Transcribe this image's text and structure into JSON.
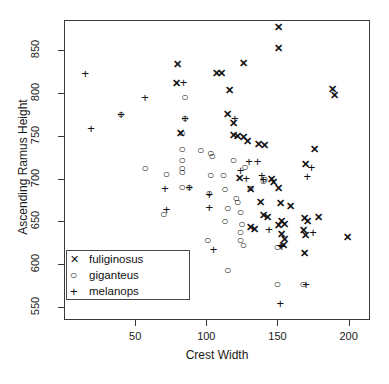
{
  "chart_data": {
    "type": "scatter",
    "title": "",
    "xlabel": "Crest Width",
    "ylabel": "Ascending Ramus Height",
    "xlim": [
      0,
      215
    ],
    "ylim": [
      535,
      885
    ],
    "xticks": [
      50,
      100,
      150,
      200
    ],
    "yticks": [
      550,
      600,
      650,
      700,
      750,
      800,
      850
    ],
    "grid": false,
    "legend_position": "bottom-left",
    "series": [
      {
        "name": "fuliginosus",
        "marker": "X",
        "glyph": "✕",
        "points": [
          [
            151,
            877
          ],
          [
            151,
            852
          ],
          [
            126,
            835
          ],
          [
            80,
            834
          ],
          [
            107,
            823
          ],
          [
            111,
            823
          ],
          [
            116,
            803
          ],
          [
            79,
            812
          ],
          [
            189,
            804
          ],
          [
            190,
            798
          ],
          [
            115,
            775
          ],
          [
            119,
            765
          ],
          [
            119,
            751
          ],
          [
            122,
            750
          ],
          [
            126,
            748
          ],
          [
            82,
            753
          ],
          [
            129,
            744
          ],
          [
            137,
            740
          ],
          [
            141,
            739
          ],
          [
            176,
            735
          ],
          [
            170,
            717
          ],
          [
            151,
            689
          ],
          [
            131,
            688
          ],
          [
            146,
            700
          ],
          [
            147,
            696
          ],
          [
            138,
            673
          ],
          [
            152,
            671
          ],
          [
            159,
            668
          ],
          [
            140,
            658
          ],
          [
            143,
            655
          ],
          [
            153,
            651
          ],
          [
            155,
            647
          ],
          [
            151,
            646
          ],
          [
            169,
            654
          ],
          [
            171,
            651
          ],
          [
            179,
            655
          ],
          [
            131,
            643
          ],
          [
            134,
            641
          ],
          [
            168,
            640
          ],
          [
            170,
            634
          ],
          [
            153,
            635
          ],
          [
            155,
            629
          ],
          [
            154,
            622
          ],
          [
            169,
            613
          ],
          [
            199,
            632
          ],
          [
            123,
            701
          ]
        ]
      },
      {
        "name": "giganteus",
        "marker": "O",
        "glyph": "○",
        "points": [
          [
            40,
            775
          ],
          [
            85,
            795
          ],
          [
            85,
            771
          ],
          [
            83,
            753
          ],
          [
            83,
            735
          ],
          [
            83,
            722
          ],
          [
            83,
            712
          ],
          [
            83,
            708
          ],
          [
            83,
            690
          ],
          [
            72,
            705
          ],
          [
            57,
            712
          ],
          [
            70,
            659
          ],
          [
            96,
            733
          ],
          [
            103,
            730
          ],
          [
            104,
            726
          ],
          [
            103,
            704
          ],
          [
            102,
            683
          ],
          [
            101,
            628
          ],
          [
            112,
            704
          ],
          [
            113,
            688
          ],
          [
            115,
            666
          ],
          [
            113,
            651
          ],
          [
            115,
            593
          ],
          [
            121,
            677
          ],
          [
            122,
            673
          ],
          [
            124,
            661
          ],
          [
            125,
            647
          ],
          [
            124,
            638
          ],
          [
            124,
            628
          ],
          [
            126,
            623
          ],
          [
            127,
            713
          ],
          [
            131,
            689
          ],
          [
            141,
            700
          ],
          [
            140,
            697
          ],
          [
            150,
            620
          ],
          [
            168,
            577
          ],
          [
            150,
            577
          ],
          [
            119,
            722
          ],
          [
            88,
            690
          ]
        ]
      },
      {
        "name": "melanops",
        "marker": "+",
        "glyph": "+",
        "points": [
          [
            15,
            823
          ],
          [
            19,
            759
          ],
          [
            57,
            795
          ],
          [
            84,
            813
          ],
          [
            71,
            689
          ],
          [
            72,
            665
          ],
          [
            88,
            690
          ],
          [
            102,
            682
          ],
          [
            102,
            667
          ],
          [
            105,
            618
          ],
          [
            124,
            710
          ],
          [
            130,
            721
          ],
          [
            136,
            721
          ],
          [
            139,
            704
          ],
          [
            140,
            700
          ],
          [
            152,
            622
          ],
          [
            153,
            621
          ],
          [
            171,
            703
          ],
          [
            174,
            714
          ],
          [
            175,
            638
          ],
          [
            152,
            555
          ],
          [
            170,
            577
          ],
          [
            144,
            641
          ],
          [
            40,
            775
          ],
          [
            85,
            771
          ],
          [
            120,
            771
          ],
          [
            128,
            701
          ]
        ]
      }
    ]
  },
  "legend": {
    "entries": [
      {
        "symbol": "X",
        "label": "fuliginosus"
      },
      {
        "symbol": "O",
        "label": "giganteus"
      },
      {
        "symbol": "+",
        "label": "melanops"
      }
    ]
  },
  "axes": {
    "y_tick_labels": [
      "850",
      "800",
      "750",
      "700",
      "650",
      "600",
      "550"
    ],
    "x_tick_labels": [
      "50",
      "100",
      "150",
      "200"
    ]
  },
  "colors": {
    "frame": "#3a3a3a",
    "marker": "#111111",
    "background": "#ffffff"
  }
}
